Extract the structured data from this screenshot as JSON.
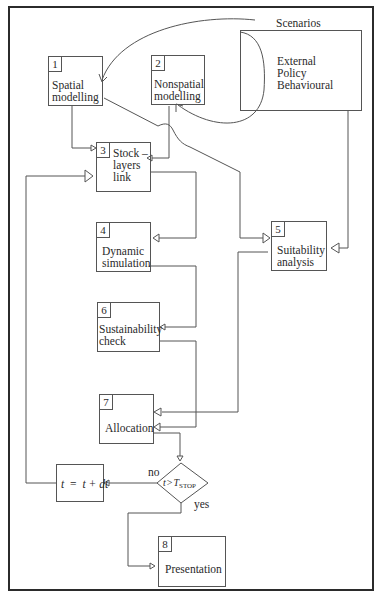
{
  "diagram": {
    "title": "Scenarios",
    "scenarios_box": {
      "lines": [
        "External",
        "Policy",
        "Behavioural"
      ]
    },
    "nodes": [
      {
        "id": 1,
        "number": "1",
        "lines": [
          "Spatial",
          "modelling"
        ]
      },
      {
        "id": 2,
        "number": "2",
        "lines": [
          "Nonspatial",
          "modelling"
        ]
      },
      {
        "id": 3,
        "number": "3",
        "lines": [
          "Stock –",
          "layers",
          "link"
        ]
      },
      {
        "id": 4,
        "number": "4",
        "lines": [
          "Dynamic",
          "simulation"
        ]
      },
      {
        "id": 5,
        "number": "5",
        "lines": [
          "Suitability",
          "analysis"
        ]
      },
      {
        "id": 6,
        "number": "6",
        "lines": [
          "Sustainability",
          "check"
        ]
      },
      {
        "id": 7,
        "number": "7",
        "lines": [
          "Allocation"
        ]
      },
      {
        "id": 8,
        "number": "8",
        "lines": [
          "Presentation"
        ]
      }
    ],
    "decision": {
      "var": "t",
      "op": ">",
      "rhs": "T",
      "rhs_sub": "STOP",
      "no_label": "no",
      "yes_label": "yes"
    },
    "update_step": {
      "text_left": "t",
      "eq": "=",
      "text_right": "t + dt"
    },
    "edges": [
      {
        "from": "Scenarios",
        "to": "1"
      },
      {
        "from": "Scenarios",
        "to": "2"
      },
      {
        "from": "Scenarios",
        "to": "5"
      },
      {
        "from": "1",
        "to": "3"
      },
      {
        "from": "1",
        "to": "5"
      },
      {
        "from": "2",
        "to": "3"
      },
      {
        "from": "3",
        "to": "4"
      },
      {
        "from": "4",
        "to": "6"
      },
      {
        "from": "5",
        "to": "7"
      },
      {
        "from": "6",
        "to": "7"
      },
      {
        "from": "7",
        "to": "decision"
      },
      {
        "from": "decision",
        "to": "update_step",
        "label": "no"
      },
      {
        "from": "decision",
        "to": "8",
        "label": "yes"
      },
      {
        "from": "update_step",
        "to": "3"
      }
    ]
  }
}
